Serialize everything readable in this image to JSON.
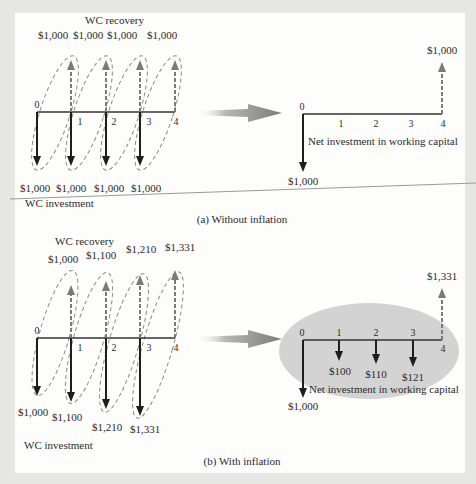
{
  "panel_a": {
    "caption": "(a) Without inflation",
    "left": {
      "top_label": "WC recovery",
      "bottom_label": "WC investment",
      "periods": [
        "0",
        "1",
        "2",
        "3",
        "4"
      ],
      "recovery_values": [
        "$1,000",
        "$1,000",
        "$1,000",
        "$1,000"
      ],
      "investment_values": [
        "$1,000",
        "$1,000",
        "$1,000",
        "$1,000"
      ]
    },
    "right": {
      "periods": [
        "0",
        "1",
        "2",
        "3",
        "4"
      ],
      "net_label": "Net investment in working capital",
      "initial_outflow": "$1,000",
      "final_inflow": "$1,000"
    }
  },
  "panel_b": {
    "caption": "(b) With inflation",
    "left": {
      "top_label": "WC recovery",
      "bottom_label": "WC investment",
      "periods": [
        "0",
        "1",
        "2",
        "3",
        "4"
      ],
      "recovery_values": [
        "$1,000",
        "$1,100",
        "$1,210",
        "$1,331"
      ],
      "investment_values": [
        "$1,000",
        "$1,100",
        "$1,210",
        "$1,331"
      ]
    },
    "right": {
      "periods": [
        "0",
        "1",
        "2",
        "3",
        "4"
      ],
      "net_label": "Net investment in working capital",
      "initial_outflow": "$1,000",
      "incremental_outflows": [
        "$100",
        "$110",
        "$121"
      ],
      "final_inflow": "$1,331"
    }
  },
  "colors": {
    "page": "#fdfdfc",
    "border": "#e6e6e4",
    "axis": "#333333",
    "solid_arrow": "#1e1e1e",
    "dashed_arrow": "#7a7a7a",
    "ellipse_dash": "#888888",
    "shaded_ellipse": "#d3d3d3",
    "transition_arrow": "#8a8a8a"
  }
}
